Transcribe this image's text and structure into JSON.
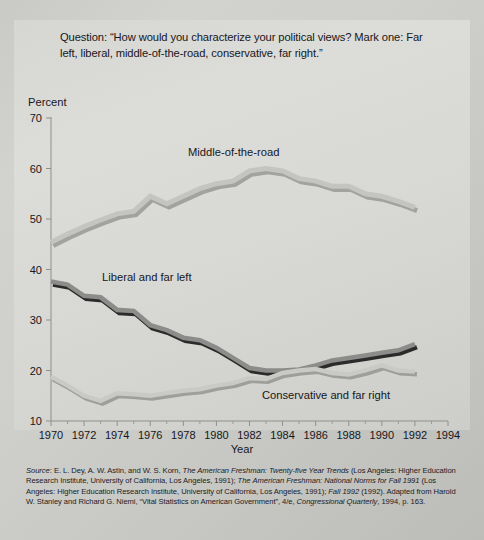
{
  "question": "Question: “How would you characterize your political views? Mark one: Far left, liberal, middle-of-the-road, conservative, far right.”",
  "axis": {
    "ylabel": "Percent",
    "xlabel": "Year"
  },
  "source": {
    "label": "Source",
    "text": ": E. L. Dey, A. W. Astin, and W. S. Korn, The American Freshman: Twenty-five Year Trends (Los Angeles: Higher Education Research Institute, University of California, Los Angeles, 1991); The American Freshman: National Norms for Fall 1991 (Los Angeles: Higher Education Research Institute, University of California, Los Angeles, 1991); Fall 1992 (1992). Adapted from Harold W. Stanley and Richard G. Niemi, “Vital Statistics on American Government”, 4/e, Congressional Quarterly, 1994, p. 163.",
    "line1_a": ": E. L. Dey, A. W. Astin, and W. S. Korn, ",
    "line1_i": "The American Freshman: Twenty-five Year Trends",
    "line1_b": " (Los",
    "line2_a": "Angeles: Higher Education Research Institute, University of California, Los Angeles, 1991); ",
    "line2_i": "The",
    "line3_i": "American Freshman: National Norms for Fall 1991",
    "line3_b": " (Los Angeles: Higher Education Research Institute,",
    "line4_a": "University of California, Los Angeles, 1991); ",
    "line4_i": "Fall 1992",
    "line4_b": " (1992). Adapted from Harold W. Stanley and",
    "line5_a": "Richard G. Niemi, “Vital Statistics on American Government”, 4/e, ",
    "line5_i": "Congressional Quarterly",
    "line5_b": ", 1994,",
    "line6": "p. 163."
  },
  "annotations": {
    "middle": "Middle-of-the-road",
    "liberal": "Liberal and far left",
    "conservative": "Conservative and far right"
  },
  "colors": {
    "background": "#cfcfcc",
    "plate": "#d8d8d5",
    "middle_top": "#c4c4c0",
    "middle_side": "#a2a29e",
    "liberal_top": "#8c8c8a",
    "liberal_side": "#2b2b2b",
    "conservative_top": "#c9c9c5",
    "conservative_side": "#9e9e9a",
    "axis": "#8f8f8d",
    "text": "#17171a"
  },
  "chart_data": {
    "type": "line",
    "title": "",
    "xlabel": "Year",
    "ylabel": "Percent",
    "xlim": [
      1970,
      1994
    ],
    "ylim": [
      10,
      70
    ],
    "yticks": [
      10,
      20,
      30,
      40,
      50,
      60,
      70
    ],
    "xticks": [
      1970,
      1972,
      1974,
      1976,
      1978,
      1980,
      1982,
      1984,
      1986,
      1988,
      1990,
      1992,
      1994
    ],
    "grid": false,
    "legend": "inline annotations",
    "x": [
      1970,
      1971,
      1972,
      1973,
      1974,
      1975,
      1976,
      1977,
      1978,
      1979,
      1980,
      1981,
      1982,
      1983,
      1984,
      1985,
      1986,
      1987,
      1988,
      1989,
      1990,
      1991,
      1992
    ],
    "series": [
      {
        "name": "Middle-of-the-road",
        "values": [
          45.4,
          47.0,
          48.5,
          49.8,
          51.0,
          51.5,
          54.5,
          53.0,
          54.5,
          56.0,
          57.0,
          57.5,
          59.5,
          60.0,
          59.5,
          58.0,
          57.5,
          56.5,
          56.5,
          55.0,
          54.5,
          53.5,
          52.3
        ]
      },
      {
        "name": "Liberal and far left",
        "values": [
          37.6,
          37.0,
          34.8,
          34.5,
          32.0,
          31.8,
          29.0,
          28.0,
          26.5,
          26.0,
          24.5,
          22.5,
          20.5,
          20.0,
          20.0,
          20.2,
          21.0,
          22.0,
          22.5,
          23.0,
          23.5,
          24.0,
          25.2
        ]
      },
      {
        "name": "Conservative and far right",
        "values": [
          18.8,
          17.0,
          15.0,
          14.0,
          15.5,
          15.3,
          15.0,
          15.5,
          16.0,
          16.3,
          17.0,
          17.5,
          18.5,
          18.3,
          19.5,
          20.0,
          20.3,
          19.5,
          19.2,
          20.0,
          21.0,
          20.0,
          19.8
        ]
      }
    ]
  }
}
